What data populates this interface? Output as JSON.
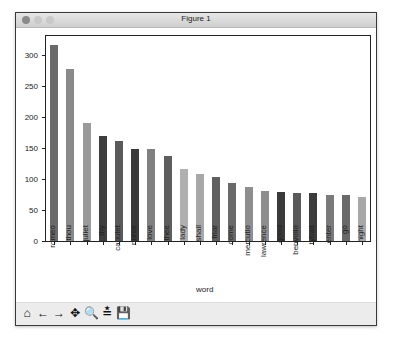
{
  "window": {
    "title": "Figure 1"
  },
  "toolbar": {
    "items": [
      {
        "name": "home-icon",
        "glyph": "⌂"
      },
      {
        "name": "back-arrow-icon",
        "glyph": "←"
      },
      {
        "name": "forward-arrow-icon",
        "glyph": "→"
      },
      {
        "name": "pan-icon",
        "glyph": "✥"
      },
      {
        "name": "zoom-icon",
        "glyph": "🔍"
      },
      {
        "name": "configure-subplots-icon",
        "glyph": "≛"
      },
      {
        "name": "save-icon",
        "glyph": "💾"
      }
    ]
  },
  "chart_data": {
    "type": "bar",
    "title": "",
    "xlabel": "word",
    "ylabel": "",
    "categories": [
      "romeo",
      "thou",
      "juliet",
      "thy",
      "capulet",
      "nurse",
      "love",
      "thee",
      "lady",
      "shall",
      "friar",
      "come",
      "mercutio",
      "lawrence",
      "good",
      "benvolio",
      "tybalt",
      "enter",
      "go",
      "night"
    ],
    "values": [
      316,
      278,
      191,
      170,
      162,
      149,
      148,
      138,
      117,
      109,
      104,
      93,
      87,
      80,
      79,
      77,
      77,
      74,
      74,
      71
    ],
    "colors": [
      "#6a6a6a",
      "#8a8a8a",
      "#9a9a9a",
      "#3e3e3e",
      "#5a5a5a",
      "#3a3a3a",
      "#808080",
      "#5e5e5e",
      "#b0b0b0",
      "#a8a8a8",
      "#606060",
      "#6a6a6a",
      "#8e8e8e",
      "#8e8e8e",
      "#3a3a3a",
      "#5a5a5a",
      "#3c3c3c",
      "#7a7a7a",
      "#6a6a6a",
      "#a8a8a8"
    ],
    "yticks": [
      0,
      50,
      100,
      150,
      200,
      250,
      300
    ],
    "ylim": [
      0,
      331
    ],
    "grid": false,
    "legend": null
  }
}
